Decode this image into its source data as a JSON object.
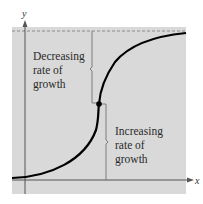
{
  "figure": {
    "axes": {
      "x_label": "x",
      "y_label": "y"
    },
    "annotations": {
      "upper": [
        "Decreasing",
        "rate of",
        "growth"
      ],
      "lower": [
        "Increasing",
        "rate of",
        "growth"
      ]
    },
    "curve": {
      "type": "logistic",
      "inflection_point_marked": true
    },
    "asymptote": {
      "style": "dashed",
      "orientation": "horizontal"
    },
    "colors": {
      "panel": "#d9d9d9",
      "curve": "#000000",
      "axis": "#555555",
      "bracket": "#666666"
    }
  }
}
